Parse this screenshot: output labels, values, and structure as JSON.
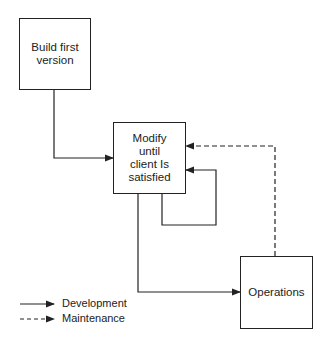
{
  "nodes": {
    "build": {
      "label": "Build first version"
    },
    "modify": {
      "label": "Modify until client Is satisfied"
    },
    "operations": {
      "label": "Operations"
    }
  },
  "legend": {
    "development": "Development",
    "maintenance": "Maintenance"
  },
  "edges": [
    {
      "from": "build",
      "to": "modify",
      "style": "solid"
    },
    {
      "from": "modify",
      "to": "modify",
      "style": "solid"
    },
    {
      "from": "modify",
      "to": "operations",
      "style": "solid"
    },
    {
      "from": "operations",
      "to": "modify",
      "style": "dashed"
    }
  ]
}
